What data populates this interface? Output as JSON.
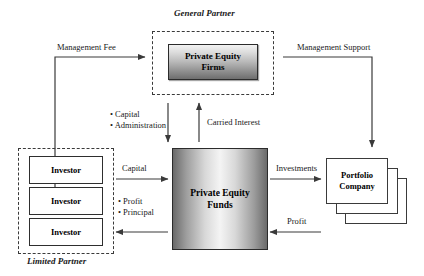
{
  "diagram": {
    "title_general_partner": "General Partner",
    "title_limited_partner": "Limited Partner",
    "nodes": {
      "pe_firms": "Private Equity Firms",
      "pe_firms_line1": "Private Equity",
      "pe_firms_line2": "Firms",
      "pe_funds_line1": "Private Equity",
      "pe_funds_line2": "Funds",
      "portfolio_line1": "Portfolio",
      "portfolio_line2": "Company",
      "investor_1": "Investor",
      "investor_2": "Investor",
      "investor_3": "Investor"
    },
    "edges": {
      "management_fee": "Management Fee",
      "management_support": "Management Support",
      "capital_admin_1": "• Capital",
      "capital_admin_2": "• Administration",
      "carried_interest": "Carried Interest",
      "capital": "Capital",
      "profit_principal_1": "• Profit",
      "profit_principal_2": "• Principal",
      "investments": "Investments",
      "profit": "Profit"
    },
    "colors": {
      "line": "#3a3a3a",
      "text": "#1a1a1a",
      "box_border": "#2b2b2b",
      "background": "#ffffff"
    }
  }
}
